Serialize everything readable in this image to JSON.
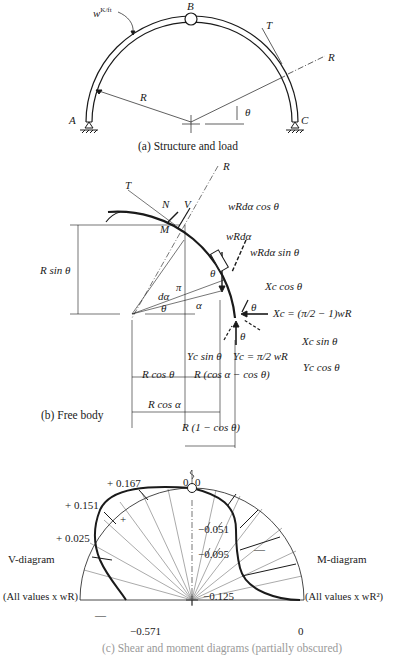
{
  "figure_a": {
    "load_label": "w K/ft",
    "load_w": "w",
    "load_units": "K/ft",
    "hinge_label": "B",
    "support_left": "A",
    "support_right": "C",
    "tangent_label": "T",
    "radial_label": "R",
    "radius_label": "R",
    "angle_label": "θ",
    "caption": "(a) Structure and load"
  },
  "figure_b": {
    "radial_label": "R",
    "tangent_label": "T",
    "normal_force": "N",
    "shear_force": "V",
    "moment": "M",
    "load_cos": "wRdα cos θ",
    "load": "wRdα",
    "load_sin": "wRdα sin θ",
    "height_dim": "R sin θ",
    "d_alpha": "dα",
    "pi_label": "π",
    "alpha": "α",
    "theta1": "θ",
    "theta2": "θ",
    "xc_cos": "Xc cos θ",
    "xc_eq": "Xc = (π/2 − 1)wR",
    "xc_sin": "Xc sin θ",
    "yc_sin": "Yc sin θ",
    "yc_eq": "Yc = π/2 wR",
    "yc_cos": "Yc cos θ",
    "theta3": "θ",
    "theta4": "θ",
    "dim_rcos_theta": "R cos θ",
    "dim_rcos_diff": "R (cos α − cos θ)",
    "dim_rcos_alpha": "R cos α",
    "dim_r1cos": "R (1 − cos θ)",
    "caption": "(b) Free body"
  },
  "figure_c": {
    "v_diagram_title": "V-diagram",
    "v_diagram_units": "(All values x wR)",
    "m_diagram_title": "M-diagram",
    "m_diagram_units": "(All values x wR²)",
    "v_values": [
      "+ 0.167",
      "+ 0.151",
      "+ 0.025",
      "−0.571"
    ],
    "v_top": "0",
    "m_top": "0",
    "m_values": [
      "−0.051",
      "−0.095",
      "−0.125"
    ],
    "m_end": "0",
    "v_sign_pos": "+",
    "v_sign_neg": "—",
    "m_sign_neg": "—",
    "caption": "(c) Shear and moment diagrams (partially obscured)"
  }
}
